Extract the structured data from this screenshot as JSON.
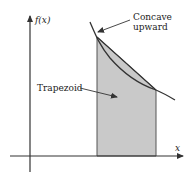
{
  "diagram": {
    "type": "trapezoid-rule-illustration",
    "y_axis_label": "f(x)",
    "x_axis_label": "x",
    "annotations": {
      "curve_label_line1": "Concave",
      "curve_label_line2": "upward",
      "region_label": "Trapezoid"
    },
    "colors": {
      "fill": "#c9c9c9",
      "line": "#333333",
      "background": "#ffffff"
    }
  }
}
